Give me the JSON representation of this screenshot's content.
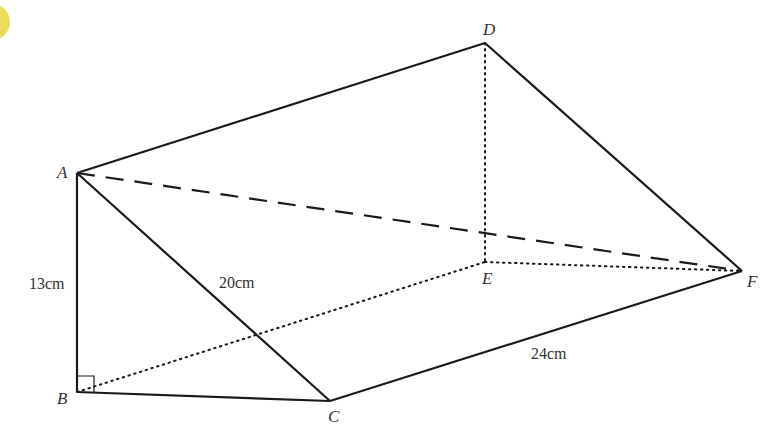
{
  "figure": {
    "type": "triangular-prism",
    "colors": {
      "line": "#1a1a1a",
      "label": "#333333",
      "badge": "#e8d84a"
    },
    "vertices": {
      "A": {
        "label": "A",
        "x": 77,
        "y": 173
      },
      "B": {
        "label": "B",
        "x": 77,
        "y": 392
      },
      "C": {
        "label": "C",
        "x": 330,
        "y": 401
      },
      "D": {
        "label": "D",
        "x": 485,
        "y": 43
      },
      "E": {
        "label": "E",
        "x": 485,
        "y": 262
      },
      "F": {
        "label": "F",
        "x": 742,
        "y": 271
      }
    },
    "edges": {
      "solid": [
        "AB",
        "BC",
        "AC",
        "AD",
        "DF",
        "CF"
      ],
      "dotted": [
        "BE",
        "DE",
        "EF"
      ],
      "dashed": [
        "AF"
      ]
    },
    "right_angle_at": "B",
    "measurements": {
      "AB": "13cm",
      "AC": "20cm",
      "CF": "24cm"
    }
  }
}
